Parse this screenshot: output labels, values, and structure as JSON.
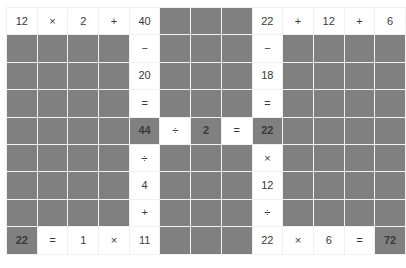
{
  "puzzle": {
    "title": "Math crossword grid",
    "type": "math-crossword",
    "columns": 11,
    "rows": 9,
    "colors": {
      "blank_cell": "#808080",
      "filled_cell": "#ffffff",
      "grid_line": "#f1f1f1",
      "text": "#3a3a3a",
      "emphasis_text": "#1e1e1e"
    },
    "cells": [
      [
        {
          "text": "12",
          "fill": "white",
          "bold": false,
          "kind": "number"
        },
        {
          "text": "×",
          "fill": "white",
          "bold": false,
          "kind": "operator"
        },
        {
          "text": "2",
          "fill": "white",
          "bold": false,
          "kind": "number"
        },
        {
          "text": "+",
          "fill": "white",
          "bold": false,
          "kind": "operator"
        },
        {
          "text": "40",
          "fill": "white",
          "bold": false,
          "kind": "number"
        },
        {
          "text": "",
          "fill": "gray",
          "bold": false,
          "kind": "blank"
        },
        {
          "text": "",
          "fill": "gray",
          "bold": false,
          "kind": "blank"
        },
        {
          "text": "",
          "fill": "gray",
          "bold": false,
          "kind": "blank"
        },
        {
          "text": "22",
          "fill": "white",
          "bold": false,
          "kind": "number"
        },
        {
          "text": "+",
          "fill": "white",
          "bold": false,
          "kind": "operator"
        },
        {
          "text": "12",
          "fill": "white",
          "bold": false,
          "kind": "number"
        },
        {
          "text": "+",
          "fill": "white",
          "bold": false,
          "kind": "operator"
        },
        {
          "text": "6",
          "fill": "white",
          "bold": false,
          "kind": "number"
        }
      ],
      [
        {
          "text": "",
          "fill": "gray",
          "bold": false,
          "kind": "blank"
        },
        {
          "text": "",
          "fill": "gray",
          "bold": false,
          "kind": "blank"
        },
        {
          "text": "",
          "fill": "gray",
          "bold": false,
          "kind": "blank"
        },
        {
          "text": "",
          "fill": "gray",
          "bold": false,
          "kind": "blank"
        },
        {
          "text": "−",
          "fill": "white",
          "bold": false,
          "kind": "operator"
        },
        {
          "text": "",
          "fill": "gray",
          "bold": false,
          "kind": "blank"
        },
        {
          "text": "",
          "fill": "gray",
          "bold": false,
          "kind": "blank"
        },
        {
          "text": "",
          "fill": "gray",
          "bold": false,
          "kind": "blank"
        },
        {
          "text": "−",
          "fill": "white",
          "bold": false,
          "kind": "operator"
        },
        {
          "text": "",
          "fill": "gray",
          "bold": false,
          "kind": "blank"
        },
        {
          "text": "",
          "fill": "gray",
          "bold": false,
          "kind": "blank"
        },
        {
          "text": "",
          "fill": "gray",
          "bold": false,
          "kind": "blank"
        },
        {
          "text": "",
          "fill": "gray",
          "bold": false,
          "kind": "blank"
        }
      ],
      [
        {
          "text": "",
          "fill": "gray",
          "bold": false,
          "kind": "blank"
        },
        {
          "text": "",
          "fill": "gray",
          "bold": false,
          "kind": "blank"
        },
        {
          "text": "",
          "fill": "gray",
          "bold": false,
          "kind": "blank"
        },
        {
          "text": "",
          "fill": "gray",
          "bold": false,
          "kind": "blank"
        },
        {
          "text": "20",
          "fill": "white",
          "bold": false,
          "kind": "number"
        },
        {
          "text": "",
          "fill": "gray",
          "bold": false,
          "kind": "blank"
        },
        {
          "text": "",
          "fill": "gray",
          "bold": false,
          "kind": "blank"
        },
        {
          "text": "",
          "fill": "gray",
          "bold": false,
          "kind": "blank"
        },
        {
          "text": "18",
          "fill": "white",
          "bold": false,
          "kind": "number"
        },
        {
          "text": "",
          "fill": "gray",
          "bold": false,
          "kind": "blank"
        },
        {
          "text": "",
          "fill": "gray",
          "bold": false,
          "kind": "blank"
        },
        {
          "text": "",
          "fill": "gray",
          "bold": false,
          "kind": "blank"
        },
        {
          "text": "",
          "fill": "gray",
          "bold": false,
          "kind": "blank"
        }
      ],
      [
        {
          "text": "",
          "fill": "gray",
          "bold": false,
          "kind": "blank"
        },
        {
          "text": "",
          "fill": "gray",
          "bold": false,
          "kind": "blank"
        },
        {
          "text": "",
          "fill": "gray",
          "bold": false,
          "kind": "blank"
        },
        {
          "text": "",
          "fill": "gray",
          "bold": false,
          "kind": "blank"
        },
        {
          "text": "=",
          "fill": "white",
          "bold": false,
          "kind": "operator"
        },
        {
          "text": "",
          "fill": "gray",
          "bold": false,
          "kind": "blank"
        },
        {
          "text": "",
          "fill": "gray",
          "bold": false,
          "kind": "blank"
        },
        {
          "text": "",
          "fill": "gray",
          "bold": false,
          "kind": "blank"
        },
        {
          "text": "=",
          "fill": "white",
          "bold": false,
          "kind": "operator"
        },
        {
          "text": "",
          "fill": "gray",
          "bold": false,
          "kind": "blank"
        },
        {
          "text": "",
          "fill": "gray",
          "bold": false,
          "kind": "blank"
        },
        {
          "text": "",
          "fill": "gray",
          "bold": false,
          "kind": "blank"
        },
        {
          "text": "",
          "fill": "gray",
          "bold": false,
          "kind": "blank"
        }
      ],
      [
        {
          "text": "",
          "fill": "gray",
          "bold": false,
          "kind": "blank"
        },
        {
          "text": "",
          "fill": "gray",
          "bold": false,
          "kind": "blank"
        },
        {
          "text": "",
          "fill": "gray",
          "bold": false,
          "kind": "blank"
        },
        {
          "text": "",
          "fill": "gray",
          "bold": false,
          "kind": "blank"
        },
        {
          "text": "44",
          "fill": "gray",
          "bold": true,
          "kind": "number"
        },
        {
          "text": "÷",
          "fill": "white",
          "bold": false,
          "kind": "operator"
        },
        {
          "text": "2",
          "fill": "gray",
          "bold": true,
          "kind": "number"
        },
        {
          "text": "=",
          "fill": "white",
          "bold": false,
          "kind": "operator"
        },
        {
          "text": "22",
          "fill": "gray",
          "bold": true,
          "kind": "number"
        },
        {
          "text": "",
          "fill": "gray",
          "bold": false,
          "kind": "blank"
        },
        {
          "text": "",
          "fill": "gray",
          "bold": false,
          "kind": "blank"
        },
        {
          "text": "",
          "fill": "gray",
          "bold": false,
          "kind": "blank"
        },
        {
          "text": "",
          "fill": "gray",
          "bold": false,
          "kind": "blank"
        }
      ],
      [
        {
          "text": "",
          "fill": "gray",
          "bold": false,
          "kind": "blank"
        },
        {
          "text": "",
          "fill": "gray",
          "bold": false,
          "kind": "blank"
        },
        {
          "text": "",
          "fill": "gray",
          "bold": false,
          "kind": "blank"
        },
        {
          "text": "",
          "fill": "gray",
          "bold": false,
          "kind": "blank"
        },
        {
          "text": "÷",
          "fill": "white",
          "bold": false,
          "kind": "operator"
        },
        {
          "text": "",
          "fill": "gray",
          "bold": false,
          "kind": "blank"
        },
        {
          "text": "",
          "fill": "gray",
          "bold": false,
          "kind": "blank"
        },
        {
          "text": "",
          "fill": "gray",
          "bold": false,
          "kind": "blank"
        },
        {
          "text": "×",
          "fill": "white",
          "bold": false,
          "kind": "operator"
        },
        {
          "text": "",
          "fill": "gray",
          "bold": false,
          "kind": "blank"
        },
        {
          "text": "",
          "fill": "gray",
          "bold": false,
          "kind": "blank"
        },
        {
          "text": "",
          "fill": "gray",
          "bold": false,
          "kind": "blank"
        },
        {
          "text": "",
          "fill": "gray",
          "bold": false,
          "kind": "blank"
        }
      ],
      [
        {
          "text": "",
          "fill": "gray",
          "bold": false,
          "kind": "blank"
        },
        {
          "text": "",
          "fill": "gray",
          "bold": false,
          "kind": "blank"
        },
        {
          "text": "",
          "fill": "gray",
          "bold": false,
          "kind": "blank"
        },
        {
          "text": "",
          "fill": "gray",
          "bold": false,
          "kind": "blank"
        },
        {
          "text": "4",
          "fill": "white",
          "bold": false,
          "kind": "number"
        },
        {
          "text": "",
          "fill": "gray",
          "bold": false,
          "kind": "blank"
        },
        {
          "text": "",
          "fill": "gray",
          "bold": false,
          "kind": "blank"
        },
        {
          "text": "",
          "fill": "gray",
          "bold": false,
          "kind": "blank"
        },
        {
          "text": "12",
          "fill": "white",
          "bold": false,
          "kind": "number"
        },
        {
          "text": "",
          "fill": "gray",
          "bold": false,
          "kind": "blank"
        },
        {
          "text": "",
          "fill": "gray",
          "bold": false,
          "kind": "blank"
        },
        {
          "text": "",
          "fill": "gray",
          "bold": false,
          "kind": "blank"
        },
        {
          "text": "",
          "fill": "gray",
          "bold": false,
          "kind": "blank"
        }
      ],
      [
        {
          "text": "",
          "fill": "gray",
          "bold": false,
          "kind": "blank"
        },
        {
          "text": "",
          "fill": "gray",
          "bold": false,
          "kind": "blank"
        },
        {
          "text": "",
          "fill": "gray",
          "bold": false,
          "kind": "blank"
        },
        {
          "text": "",
          "fill": "gray",
          "bold": false,
          "kind": "blank"
        },
        {
          "text": "+",
          "fill": "white",
          "bold": false,
          "kind": "operator"
        },
        {
          "text": "",
          "fill": "gray",
          "bold": false,
          "kind": "blank"
        },
        {
          "text": "",
          "fill": "gray",
          "bold": false,
          "kind": "blank"
        },
        {
          "text": "",
          "fill": "gray",
          "bold": false,
          "kind": "blank"
        },
        {
          "text": "÷",
          "fill": "white",
          "bold": false,
          "kind": "operator"
        },
        {
          "text": "",
          "fill": "gray",
          "bold": false,
          "kind": "blank"
        },
        {
          "text": "",
          "fill": "gray",
          "bold": false,
          "kind": "blank"
        },
        {
          "text": "",
          "fill": "gray",
          "bold": false,
          "kind": "blank"
        },
        {
          "text": "",
          "fill": "gray",
          "bold": false,
          "kind": "blank"
        }
      ],
      [
        {
          "text": "22",
          "fill": "gray",
          "bold": true,
          "kind": "number"
        },
        {
          "text": "=",
          "fill": "white",
          "bold": false,
          "kind": "operator"
        },
        {
          "text": "1",
          "fill": "white",
          "bold": false,
          "kind": "number"
        },
        {
          "text": "×",
          "fill": "white",
          "bold": false,
          "kind": "operator"
        },
        {
          "text": "11",
          "fill": "white",
          "bold": false,
          "kind": "number"
        },
        {
          "text": "",
          "fill": "gray",
          "bold": false,
          "kind": "blank"
        },
        {
          "text": "",
          "fill": "gray",
          "bold": false,
          "kind": "blank"
        },
        {
          "text": "",
          "fill": "gray",
          "bold": false,
          "kind": "blank"
        },
        {
          "text": "22",
          "fill": "white",
          "bold": false,
          "kind": "number"
        },
        {
          "text": "×",
          "fill": "white",
          "bold": false,
          "kind": "operator"
        },
        {
          "text": "6",
          "fill": "white",
          "bold": false,
          "kind": "number"
        },
        {
          "text": "=",
          "fill": "white",
          "bold": false,
          "kind": "operator"
        },
        {
          "text": "72",
          "fill": "gray",
          "bold": true,
          "kind": "number"
        }
      ]
    ]
  }
}
